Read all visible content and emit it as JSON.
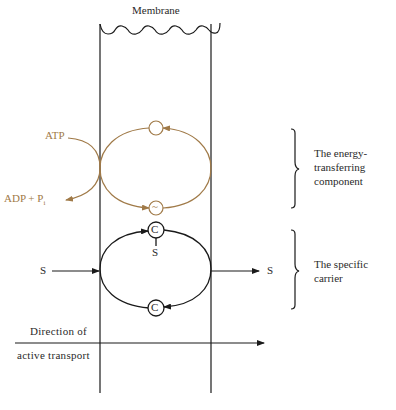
{
  "diagram": {
    "membrane_label": "Membrane",
    "energy_component": {
      "input_label": "ATP",
      "output_label_main": "ADP + P",
      "output_label_sub": "i",
      "top_node_symbol": "",
      "bottom_node_symbol": "~",
      "bracket_label": "The energy-transferring component"
    },
    "carrier_component": {
      "top_node_symbol": "C",
      "attached_substrate": "S",
      "bottom_node_symbol": "C",
      "input_substrate": "S",
      "output_substrate": "S",
      "bracket_label": "The specific carrier"
    },
    "direction": {
      "label_line1": "Direction of",
      "label_line2": "active transport"
    },
    "colors": {
      "energy": "#a07a48",
      "carrier": "#1a1a1a"
    }
  }
}
